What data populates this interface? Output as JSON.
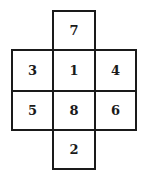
{
  "diagram": {
    "type": "cube-net",
    "cells": [
      {
        "id": "top",
        "label": "7",
        "col": 1,
        "row": 0
      },
      {
        "id": "middle-left",
        "label": "3",
        "col": 0,
        "row": 1
      },
      {
        "id": "middle-center",
        "label": "1",
        "col": 1,
        "row": 1
      },
      {
        "id": "middle-right",
        "label": "4",
        "col": 2,
        "row": 1
      },
      {
        "id": "lower-left",
        "label": "5",
        "col": 0,
        "row": 2
      },
      {
        "id": "lower-center",
        "label": "8",
        "col": 1,
        "row": 2
      },
      {
        "id": "lower-right",
        "label": "6",
        "col": 2,
        "row": 2
      },
      {
        "id": "bottom",
        "label": "2",
        "col": 1,
        "row": 3
      }
    ]
  }
}
